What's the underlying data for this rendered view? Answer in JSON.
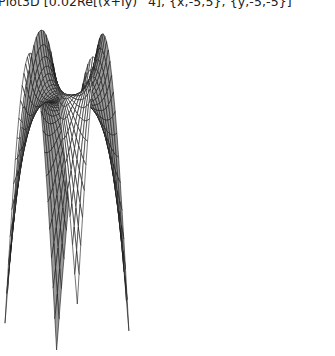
{
  "title": "Plot3D [0.02Re[(x+Iy)^4], {x,-5,5}, {y,-5,-5}]",
  "chart_data": {
    "type": "surface3d",
    "title": "Plot3D [0.02Re[(x+Iy)^4], {x,-5,5}, {y,-5,-5}]",
    "function": "0.02*Re[(x+I*y)^4]",
    "x_range": [
      -5,
      5
    ],
    "y_range": [
      -5,
      5
    ],
    "grid_lines": 30,
    "axes_shown": false,
    "style": "black mesh on white surface, gray shaded underside"
  },
  "colors": {
    "mesh": "#1a1a1a",
    "face": "#ffffff",
    "underside": "#9a9a9a"
  }
}
